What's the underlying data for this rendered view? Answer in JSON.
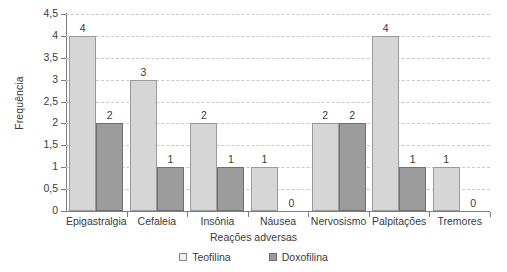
{
  "chart_data": {
    "type": "bar",
    "title": "",
    "xlabel": "Reações adversas",
    "ylabel": "Frequência",
    "categories": [
      "Epigastralgia",
      "Cefaleia",
      "Insônia",
      "Náusea",
      "Nervosismo",
      "Palpitações",
      "Tremores"
    ],
    "series": [
      {
        "name": "Teofilina",
        "values": [
          4,
          3,
          2,
          1,
          2,
          4,
          1
        ],
        "color": "#d6d6d6"
      },
      {
        "name": "Doxofilina",
        "values": [
          2,
          1,
          1,
          0,
          2,
          1,
          0
        ],
        "color": "#9c9c9c"
      }
    ],
    "ylim": [
      0,
      4.5
    ],
    "ytick_labels": [
      "0",
      "0,5",
      "1",
      "1,5",
      "2",
      "2,5",
      "3",
      "3,5",
      "4",
      "4,5"
    ],
    "ytick_values": [
      0,
      0.5,
      1,
      1.5,
      2,
      2.5,
      3,
      3.5,
      4,
      4.5
    ],
    "grid": true,
    "grid_axis": "y",
    "legend_position": "bottom",
    "data_labels": true,
    "data_labels_flat": [
      "4",
      "2",
      "3",
      "1",
      "2",
      "1",
      "1",
      "0",
      "2",
      "2",
      "4",
      "1",
      "1",
      "0"
    ]
  }
}
